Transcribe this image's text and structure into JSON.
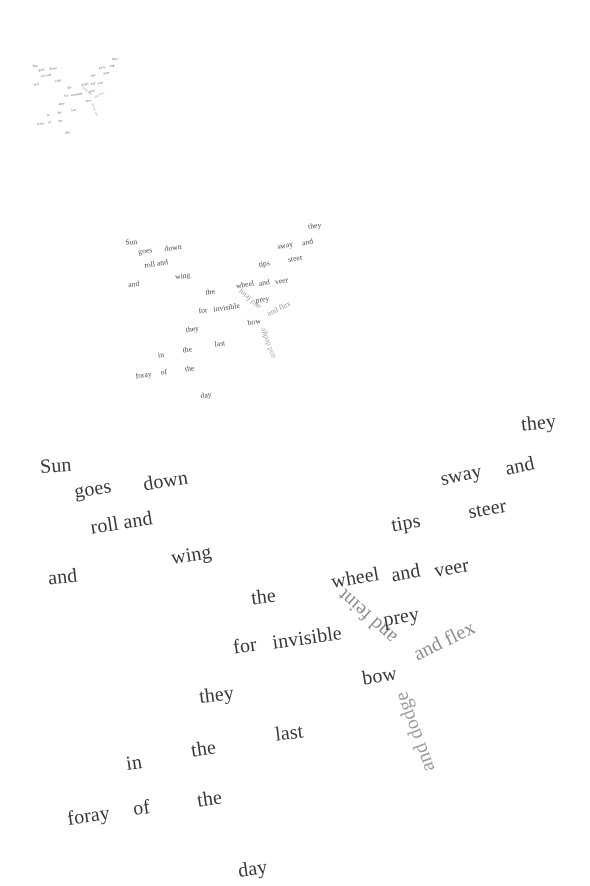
{
  "artwork": {
    "title": "Sun goes down",
    "medium": "concrete poem, recursive self-similar layout",
    "background_color": "#ffffff",
    "ink_color": "#3a3a3a",
    "accent_gray": "#8e8e8e"
  },
  "poem": {
    "full_text": "Sun goes down and roll and wing and the wheel and veer tips sway and steer they for invisible and feint prey bow and flex and dodge they last in the the foray of the day",
    "words": [
      {
        "id": "sun",
        "text": "Sun",
        "x": 40,
        "y": 455,
        "size": 20,
        "rot": -4,
        "tone": "dark"
      },
      {
        "id": "goes",
        "text": "goes",
        "x": 74,
        "y": 478,
        "size": 20,
        "rot": -9,
        "tone": "dark"
      },
      {
        "id": "down",
        "text": "down",
        "x": 143,
        "y": 470,
        "size": 20,
        "rot": -9,
        "tone": "dark"
      },
      {
        "id": "roll-and",
        "text": "roll and",
        "x": 90,
        "y": 512,
        "size": 20,
        "rot": -9,
        "tone": "dark"
      },
      {
        "id": "wing",
        "text": "wing",
        "x": 171,
        "y": 544,
        "size": 20,
        "rot": -9,
        "tone": "dark"
      },
      {
        "id": "and-left",
        "text": "and",
        "x": 48,
        "y": 566,
        "size": 20,
        "rot": -6,
        "tone": "dark"
      },
      {
        "id": "the-1",
        "text": "the",
        "x": 251,
        "y": 586,
        "size": 20,
        "rot": -7,
        "tone": "dark"
      },
      {
        "id": "wheel",
        "text": "wheel",
        "x": 331,
        "y": 567,
        "size": 20,
        "rot": -10,
        "tone": "dark"
      },
      {
        "id": "and-wheel",
        "text": "and",
        "x": 391,
        "y": 562,
        "size": 20,
        "rot": -10,
        "tone": "dark"
      },
      {
        "id": "veer",
        "text": "veer",
        "x": 434,
        "y": 557,
        "size": 20,
        "rot": -10,
        "tone": "dark"
      },
      {
        "id": "tips",
        "text": "tips",
        "x": 391,
        "y": 512,
        "size": 20,
        "rot": -10,
        "tone": "dark"
      },
      {
        "id": "sway",
        "text": "sway",
        "x": 440,
        "y": 464,
        "size": 20,
        "rot": -12,
        "tone": "dark"
      },
      {
        "id": "and-sway",
        "text": "and",
        "x": 505,
        "y": 455,
        "size": 20,
        "rot": -12,
        "tone": "dark"
      },
      {
        "id": "steer",
        "text": "steer",
        "x": 468,
        "y": 498,
        "size": 20,
        "rot": -10,
        "tone": "dark"
      },
      {
        "id": "they-top",
        "text": "they",
        "x": 521,
        "y": 412,
        "size": 20,
        "rot": -6,
        "tone": "dark"
      },
      {
        "id": "for",
        "text": "for",
        "x": 233,
        "y": 635,
        "size": 20,
        "rot": -8,
        "tone": "dark"
      },
      {
        "id": "invisible",
        "text": "invisible",
        "x": 272,
        "y": 627,
        "size": 20,
        "rot": -8,
        "tone": "dark"
      },
      {
        "id": "and-feint",
        "text": "and feint",
        "x": 331,
        "y": 607,
        "size": 20,
        "rot": 222,
        "tone": "gray"
      },
      {
        "id": "prey",
        "text": "prey",
        "x": 383,
        "y": 606,
        "size": 20,
        "rot": -10,
        "tone": "dark"
      },
      {
        "id": "bow",
        "text": "bow",
        "x": 362,
        "y": 665,
        "size": 20,
        "rot": -9,
        "tone": "dark"
      },
      {
        "id": "and-flex",
        "text": "and flex",
        "x": 411,
        "y": 630,
        "size": 20,
        "rot": -26,
        "tone": "gray"
      },
      {
        "id": "and-dodge",
        "text": "and dodge",
        "x": 372,
        "y": 722,
        "size": 20,
        "rot": 250,
        "tone": "gray2"
      },
      {
        "id": "they-mid",
        "text": "they",
        "x": 199,
        "y": 684,
        "size": 20,
        "rot": -7,
        "tone": "dark"
      },
      {
        "id": "last",
        "text": "last",
        "x": 275,
        "y": 722,
        "size": 20,
        "rot": -7,
        "tone": "dark"
      },
      {
        "id": "the-2",
        "text": "the",
        "x": 191,
        "y": 738,
        "size": 20,
        "rot": -8,
        "tone": "dark"
      },
      {
        "id": "in",
        "text": "in",
        "x": 126,
        "y": 752,
        "size": 20,
        "rot": -8,
        "tone": "dark"
      },
      {
        "id": "the-3",
        "text": "the",
        "x": 197,
        "y": 788,
        "size": 20,
        "rot": -8,
        "tone": "dark"
      },
      {
        "id": "of",
        "text": "of",
        "x": 133,
        "y": 797,
        "size": 20,
        "rot": -8,
        "tone": "dark"
      },
      {
        "id": "foray",
        "text": "foray",
        "x": 67,
        "y": 805,
        "size": 20,
        "rot": -8,
        "tone": "dark"
      },
      {
        "id": "day",
        "text": "day",
        "x": 238,
        "y": 858,
        "size": 20,
        "rot": -8,
        "tone": "dark"
      }
    ]
  },
  "copies": [
    {
      "id": "copy-large",
      "label": "primary copy",
      "scale": 1.0,
      "offset_x": 0,
      "offset_y": 0,
      "opacity": 1.0
    },
    {
      "id": "copy-medium",
      "label": "secondary copy",
      "scale": 0.38,
      "offset_x": 110,
      "offset_y": 65,
      "opacity": 0.92
    },
    {
      "id": "copy-small",
      "label": "tertiary copy",
      "scale": 0.165,
      "offset_x": 26,
      "offset_y": -11,
      "opacity": 0.85
    }
  ]
}
